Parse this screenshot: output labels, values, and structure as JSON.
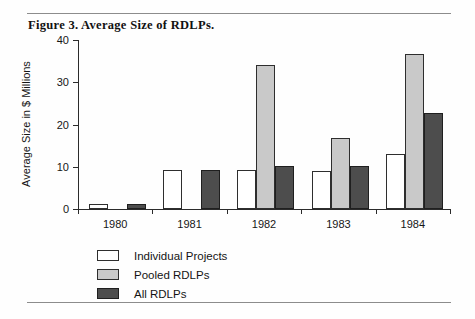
{
  "figure": {
    "title": "Figure 3. Average Size of RDLPs."
  },
  "chart_data": {
    "type": "bar",
    "title": "Figure 3. Average Size of RDLPs.",
    "xlabel": "",
    "ylabel": "Average Size in $ Millions",
    "categories": [
      "1980",
      "1981",
      "1982",
      "1983",
      "1984"
    ],
    "ylim": [
      0,
      40
    ],
    "yticks": [
      0,
      10,
      20,
      30,
      40
    ],
    "ytick_labels": [
      "0",
      "10",
      "20",
      "30",
      "40"
    ],
    "grid": false,
    "legend_position": "bottom-left",
    "series": [
      {
        "name": "Individual Projects",
        "color": "#ffffff",
        "values": [
          1.1,
          9.2,
          9.3,
          9.1,
          13.1
        ]
      },
      {
        "name": "Pooled RDLPs",
        "color": "#c9c9c9",
        "values": [
          null,
          null,
          34.1,
          16.7,
          36.7
        ]
      },
      {
        "name": "All RDLPs",
        "color": "#4d4d4d",
        "values": [
          1.1,
          9.2,
          10.1,
          10.2,
          22.8
        ]
      }
    ]
  },
  "legend": {
    "items": [
      {
        "label": "Individual Projects",
        "swatch": "individual"
      },
      {
        "label": "Pooled RDLPs",
        "swatch": "pooled"
      },
      {
        "label": "All RDLPs",
        "swatch": "all"
      }
    ]
  },
  "colors": {
    "individual": "#ffffff",
    "pooled": "#c9c9c9",
    "all": "#4d4d4d",
    "axis": "#2b2b2b",
    "rule": "#8c8c8c"
  }
}
